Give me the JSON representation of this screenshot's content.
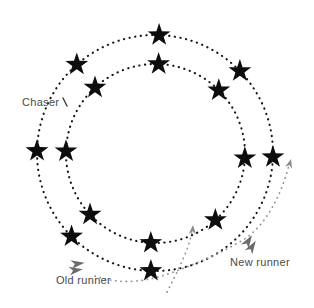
{
  "figure": {
    "width": 314,
    "height": 308,
    "background": "#ffffff"
  },
  "labels": {
    "chaser": {
      "text": "Chaser",
      "x": 22,
      "y": 96
    },
    "old_runner": {
      "text": "Old runner",
      "x": 56,
      "y": 274
    },
    "new_runner": {
      "text": "New runner",
      "x": 230,
      "y": 256
    }
  },
  "colors": {
    "star": "#0d0d0d",
    "track": "#161616",
    "arrow": "#8f8f8f",
    "arrowhead": "#8a8a8a",
    "icon": "#6b6b6b",
    "tick": "#3a3a3a",
    "label": "#4a4a4a"
  },
  "tracks": [
    {
      "name": "outer-track",
      "cx": 155,
      "cy": 153,
      "r": 118
    },
    {
      "name": "inner-track",
      "cx": 155.5,
      "cy": 153.5,
      "r": 89.5
    }
  ],
  "stars": {
    "outer_radius_px": 12,
    "inner_radius_px": 4.7,
    "outer_track_angles_deg": [
      88,
      44,
      -2,
      -92,
      -135,
      179,
      131.5
    ],
    "inner_track_angles_deg": [
      88,
      45,
      -3,
      -48,
      -93,
      -137,
      178.5,
      132.5
    ]
  },
  "arrows": [
    {
      "name": "old-runner-path-arrow",
      "d": "M 95 276 C 118 284 142 283 168 274 C 196 264 224 252 246 238 C 266 224 281 196 289 165",
      "tip": [
        291,
        159
      ],
      "tip_angle": -75
    },
    {
      "name": "new-position-arrow",
      "d": "M 167 292 C 177 272 189 250 192 231",
      "tip": [
        193,
        225
      ],
      "tip_angle": -86
    }
  ],
  "icons": [
    {
      "name": "old-runner-icon",
      "cx": 78,
      "cy": 267,
      "rotate": -6
    },
    {
      "name": "new-runner-icon",
      "cx": 251,
      "cy": 243,
      "rotate": -56
    }
  ],
  "chaser_tick": {
    "x1": 63,
    "y1": 98,
    "x2": 67,
    "y2": 106
  }
}
